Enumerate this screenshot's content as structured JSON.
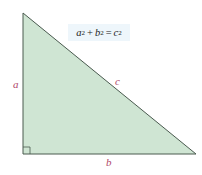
{
  "diagram": {
    "type": "right-triangle",
    "vertices": {
      "top": [
        23,
        13
      ],
      "right_angle": [
        23,
        154
      ],
      "right": [
        196,
        154
      ]
    },
    "colors": {
      "fill": "#cfe5d3",
      "stroke": "#4a5a4f",
      "label": "#b0476a",
      "formula_bg": "#eef6fb",
      "formula_text": "#222222"
    }
  },
  "formula": {
    "a": "a",
    "a_exp": "2",
    "plus": "+",
    "b": "b",
    "b_exp": "2",
    "equals": "=",
    "c": "c",
    "c_exp": "2"
  },
  "labels": {
    "side_a": "a",
    "side_b": "b",
    "side_c": "c"
  }
}
